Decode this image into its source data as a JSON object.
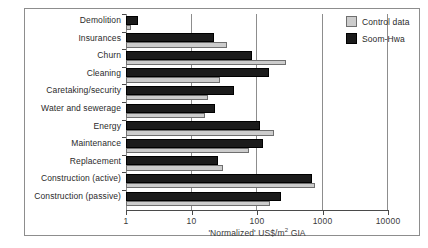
{
  "chart_data": {
    "type": "bar",
    "orientation": "horizontal",
    "title": "",
    "xlabel": "'Normalized' US$/m2 GIA",
    "ylabel": "",
    "xscale": "log",
    "xlim": [
      1,
      10000
    ],
    "xticks": [
      1,
      10,
      100,
      1000,
      10000
    ],
    "xticklabels": [
      "1",
      "10",
      "100",
      "1000",
      "10000"
    ],
    "grid": true,
    "grid_axis": "x",
    "legend_position": "top-right",
    "categories": [
      "Demolition",
      "Insurances",
      "Churn",
      "Cleaning",
      "Caretaking/security",
      "Water and sewerage",
      "Energy",
      "Maintenance",
      "Replacement",
      "Construction (active)",
      "Construction (passive)"
    ],
    "series": [
      {
        "name": "Control data",
        "color": "#cccccc",
        "values": [
          1.2,
          35,
          280,
          27,
          18,
          16,
          180,
          75,
          30,
          780,
          160
        ]
      },
      {
        "name": "Soom-Hwa",
        "color": "#1b1b1b",
        "values": [
          1.5,
          22,
          85,
          150,
          45,
          23,
          110,
          125,
          25,
          700,
          230
        ]
      }
    ]
  },
  "legend": {
    "items": [
      {
        "label": "Control data",
        "swatch": "light"
      },
      {
        "label": "Soom-Hwa",
        "swatch": "dark"
      }
    ]
  },
  "colors": {
    "control_data": "#cccccc",
    "soom_hwa": "#1b1b1b",
    "axis": "#4a4a4a",
    "grid": "#8d8d8d",
    "frame": "#8d8d8d",
    "background": "#ffffff"
  }
}
